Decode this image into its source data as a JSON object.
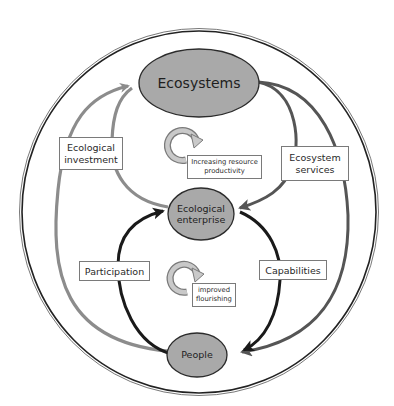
{
  "diagram": {
    "type": "cycle-diagram",
    "colors": {
      "node_fill": "#a9a9a9",
      "node_stroke": "#2b2b2b",
      "gray_arrow": "#8c8c8c",
      "dark_arrow": "#1a1a1a",
      "mid_arrow": "#555555",
      "outer_ring": "#222222"
    },
    "nodes": {
      "ecosystems": {
        "label": "Ecosystems"
      },
      "enterprise": {
        "line1": "Ecological",
        "line2": "enterprise"
      },
      "people": {
        "label": "People"
      }
    },
    "edges": {
      "ecological_investment": {
        "line1": "Ecological",
        "line2": "investment"
      },
      "ecosystem_services": {
        "line1": "Ecosystem",
        "line2": "services"
      },
      "participation": {
        "label": "Participation"
      },
      "capabilities": {
        "label": "Capabilities"
      }
    },
    "cycles": {
      "upper": {
        "line1": "Increasing resource",
        "line2": "productivity"
      },
      "lower": {
        "line1": "improved",
        "line2": "flourishing"
      }
    }
  }
}
